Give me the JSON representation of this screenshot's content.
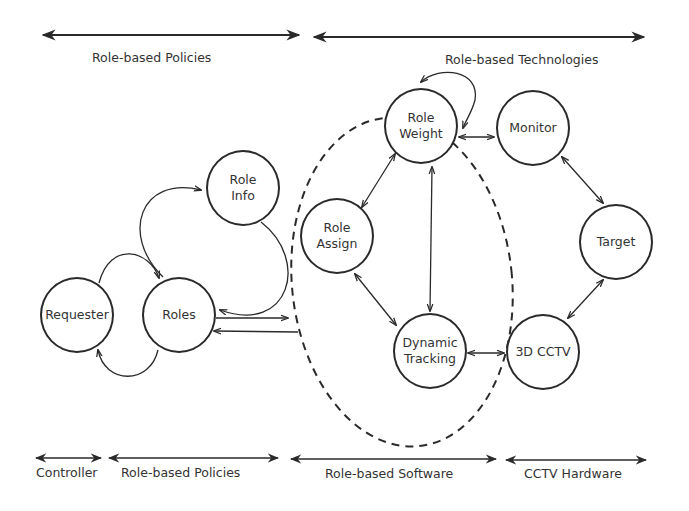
{
  "top_ranges": [
    {
      "label": "Role-based Policies"
    },
    {
      "label": "Role-based Technologies"
    }
  ],
  "bottom_ranges": [
    {
      "label": "Controller"
    },
    {
      "label": "Role-based Policies"
    },
    {
      "label": "Role-based Software"
    },
    {
      "label": "CCTV Hardware"
    }
  ],
  "nodes": {
    "role_info": {
      "label": "Role\nInfo"
    },
    "requester": {
      "label": "Requester"
    },
    "roles": {
      "label": "Roles"
    },
    "role_weight": {
      "label": "Role\nWeight"
    },
    "role_assign": {
      "label": "Role\nAssign"
    },
    "dynamic_tracking": {
      "label": "Dynamic\nTracking"
    },
    "monitor": {
      "label": "Monitor"
    },
    "target": {
      "label": "Target"
    },
    "cctv_3d": {
      "label": "3D CCTV"
    }
  },
  "edges": [
    {
      "from": "Requester",
      "to": "Roles",
      "type": "curved, top"
    },
    {
      "from": "Roles",
      "to": "Requester",
      "type": "curved, bottom"
    },
    {
      "from": "Roles",
      "to": "Role Info",
      "type": "curved, left arc"
    },
    {
      "from": "Role Info",
      "to": "Roles",
      "type": "curved, right arc"
    },
    {
      "from": "Roles",
      "to": "Role-based Software",
      "type": "straight right"
    },
    {
      "from": "Role-based Software",
      "to": "Roles",
      "type": "straight left"
    },
    {
      "from": "Role Weight",
      "to": "Role Weight",
      "type": "self-loop"
    },
    {
      "from": "Role Weight",
      "to": "Role Assign",
      "type": "bidirectional"
    },
    {
      "from": "Role Weight",
      "to": "Dynamic Tracking",
      "type": "bidirectional"
    },
    {
      "from": "Role Assign",
      "to": "Dynamic Tracking",
      "type": "bidirectional"
    },
    {
      "from": "Role Weight",
      "to": "Monitor",
      "type": "bidirectional"
    },
    {
      "from": "Monitor",
      "to": "Target",
      "type": "bidirectional"
    },
    {
      "from": "Target",
      "to": "3D CCTV",
      "type": "bidirectional"
    },
    {
      "from": "Dynamic Tracking",
      "to": "3D CCTV",
      "type": "bidirectional"
    }
  ],
  "colors": {
    "stroke": "#2a2a2a",
    "text": "#333333",
    "background": "#ffffff"
  }
}
